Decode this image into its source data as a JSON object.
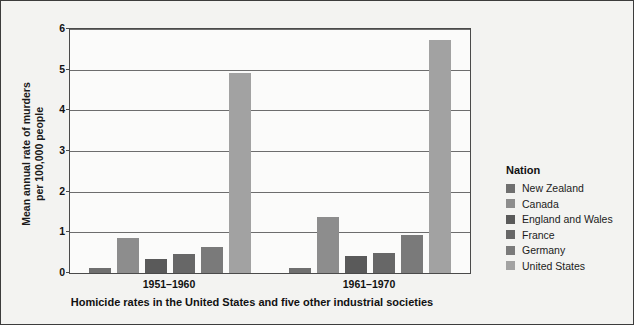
{
  "chart_data": {
    "type": "bar",
    "title": "",
    "caption": "Homicide rates in the United States and five other industrial societies",
    "xlabel": "",
    "ylabel": "Mean annual rate of murders per 100,000 people",
    "ylabel_line1": "Mean annual rate of murders",
    "ylabel_line2": "per 100,000 people",
    "ylim": [
      0,
      6
    ],
    "ytick_labels": [
      "0",
      "1",
      "2",
      "3",
      "4",
      "5",
      "6"
    ],
    "ytick_values": [
      0,
      1,
      2,
      3,
      4,
      5,
      6
    ],
    "grid": true,
    "legend_position": "right",
    "legend_title": "Nation",
    "categories": [
      "1951–1960",
      "1961–1970"
    ],
    "series": [
      {
        "name": "New Zealand",
        "color": "#6f6f6f",
        "values": [
          0.12,
          0.13
        ]
      },
      {
        "name": "Canada",
        "color": "#8d8d8d",
        "values": [
          0.87,
          1.37
        ]
      },
      {
        "name": "England and Wales",
        "color": "#5a5a5a",
        "values": [
          0.35,
          0.43
        ]
      },
      {
        "name": "France",
        "color": "#676767",
        "values": [
          0.47,
          0.5
        ]
      },
      {
        "name": "Germany",
        "color": "#7a7a7a",
        "values": [
          0.65,
          0.93
        ]
      },
      {
        "name": "United States",
        "color": "#a2a2a2",
        "values": [
          4.92,
          5.72
        ]
      }
    ]
  },
  "legend": {
    "title": "Nation",
    "items": [
      {
        "label": "New Zealand",
        "color": "#6f6f6f"
      },
      {
        "label": "Canada",
        "color": "#8d8d8d"
      },
      {
        "label": "England and Wales",
        "color": "#5a5a5a"
      },
      {
        "label": "France",
        "color": "#676767"
      },
      {
        "label": "Germany",
        "color": "#7a7a7a"
      },
      {
        "label": "United States",
        "color": "#a2a2a2"
      }
    ]
  }
}
